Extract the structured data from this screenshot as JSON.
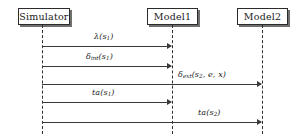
{
  "diagram": {
    "type": "uml-sequence-diagram",
    "background_color": "#ffffff",
    "line_color": "#3a3a3a",
    "text_color": "#1a1a1a",
    "shadow_color": "#6f6f6f"
  },
  "participants": [
    {
      "id": "simulator",
      "label": "Simulator",
      "x": 42
    },
    {
      "id": "model1",
      "label": "Model1",
      "x": 172
    },
    {
      "id": "model2",
      "label": "Model2",
      "x": 262
    }
  ],
  "messages": [
    {
      "index": 1,
      "from": "simulator",
      "to": "model1",
      "label_text": "λ(s1)",
      "greek": "λ",
      "base": "",
      "subscript": "",
      "arg_open": "(s",
      "arg_sub": "1",
      "arg_close": ")",
      "y": 46
    },
    {
      "index": 2,
      "from": "simulator",
      "to": "model1",
      "label_text": "δint(s1)",
      "greek": "δ",
      "base": "",
      "subscript": "int",
      "arg_open": "(s",
      "arg_sub": "1",
      "arg_close": ")",
      "y": 66
    },
    {
      "index": 3,
      "from": "simulator",
      "to": "model2",
      "label_text": "δext(s2, e, x)",
      "greek": "δ",
      "base": "",
      "subscript": "ext",
      "arg_open": "(s",
      "arg_sub": "2",
      "arg_close": ", e, x)",
      "y": 84
    },
    {
      "index": 4,
      "from": "simulator",
      "to": "model1",
      "label_text": "ta(s1)",
      "greek": "",
      "base": "ta",
      "subscript": "",
      "arg_open": "(s",
      "arg_sub": "1",
      "arg_close": ")",
      "y": 102
    },
    {
      "index": 5,
      "from": "simulator",
      "to": "model2",
      "label_text": "ta(s2)",
      "greek": "",
      "base": "ta",
      "subscript": "",
      "arg_open": "(s",
      "arg_sub": "2",
      "arg_close": ")",
      "y": 122
    }
  ]
}
